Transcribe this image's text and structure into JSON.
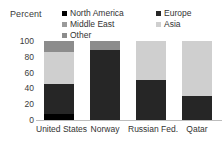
{
  "chart_data": {
    "type": "bar",
    "title": "",
    "subtitle": "",
    "xlabel": "",
    "ylabel": "Percent",
    "ylim": [
      0,
      100
    ],
    "yticks": [
      "0",
      "20",
      "40",
      "60",
      "80",
      "100"
    ],
    "grid": false,
    "stacked": true,
    "stack_total": 100,
    "legend_position": "top",
    "categories": [
      "United States",
      "Norway",
      "Russian Fed.",
      "Qatar"
    ],
    "series": [
      {
        "name": "North America",
        "color": "#000000",
        "values": [
          8,
          0,
          0,
          0
        ]
      },
      {
        "name": "Europe",
        "color": "#262626",
        "values": [
          38,
          88,
          51,
          0
        ]
      },
      {
        "name": "Middle East",
        "color": "#262626",
        "values": [
          0,
          0,
          0,
          30
        ]
      },
      {
        "name": "Asia",
        "color": "#cfcfcf",
        "values": [
          40,
          0,
          49,
          70
        ]
      },
      {
        "name": "Other",
        "color": "#8c8c8c",
        "values": [
          14,
          12,
          0,
          0
        ]
      }
    ],
    "legend_entries": [
      {
        "label": "North America",
        "color": "#000000"
      },
      {
        "label": "Europe",
        "color": "#262626"
      },
      {
        "label": "Middle East",
        "color": "#9a9a9a"
      },
      {
        "label": "Asia",
        "color": "#cfcfcf"
      },
      {
        "label": "Other",
        "color": "#8c8c8c"
      }
    ],
    "bars": [
      {
        "category": "United States",
        "segments": [
          {
            "name": "North America",
            "from": 0,
            "to": 8,
            "value": 8,
            "color": "#000000"
          },
          {
            "name": "Europe",
            "from": 8,
            "to": 46,
            "value": 38,
            "color": "#262626"
          },
          {
            "name": "Asia",
            "from": 46,
            "to": 86,
            "value": 40,
            "color": "#cfcfcf"
          },
          {
            "name": "Other",
            "from": 86,
            "to": 100,
            "value": 14,
            "color": "#8c8c8c"
          }
        ]
      },
      {
        "category": "Norway",
        "segments": [
          {
            "name": "Europe",
            "from": 0,
            "to": 88,
            "value": 88,
            "color": "#262626"
          },
          {
            "name": "Other",
            "from": 88,
            "to": 100,
            "value": 12,
            "color": "#8c8c8c"
          }
        ]
      },
      {
        "category": "Russian Fed.",
        "segments": [
          {
            "name": "Europe",
            "from": 0,
            "to": 51,
            "value": 51,
            "color": "#262626"
          },
          {
            "name": "Asia",
            "from": 51,
            "to": 100,
            "value": 49,
            "color": "#cfcfcf"
          }
        ]
      },
      {
        "category": "Qatar",
        "segments": [
          {
            "name": "Middle East",
            "from": 0,
            "to": 30,
            "value": 30,
            "color": "#262626"
          },
          {
            "name": "Asia",
            "from": 30,
            "to": 100,
            "value": 70,
            "color": "#cfcfcf"
          }
        ]
      }
    ]
  },
  "colors": {
    "background": "#ffffff",
    "axis_line": "#bdbdbd",
    "text": "#333333",
    "tick_text": "#3b3b3b"
  }
}
